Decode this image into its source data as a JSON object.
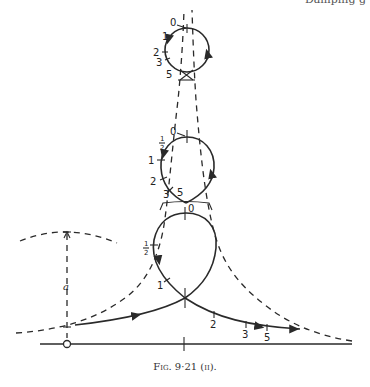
{
  "header_fragment": "Damping g",
  "caption": "Fig. 9·21 (ii).",
  "labels": {
    "amplitude": "a",
    "top_loop": [
      "0",
      "1",
      "2",
      "3",
      "5"
    ],
    "middle_loop": [
      "0",
      "½",
      "1",
      "2",
      "3",
      "5"
    ],
    "bottom_loop": [
      "0",
      "½",
      "1",
      "2",
      "3",
      "5"
    ],
    "half_num": "1",
    "half_den": "2"
  },
  "colors": {
    "ink": "#2a2a2a",
    "paper": "#ffffff"
  }
}
